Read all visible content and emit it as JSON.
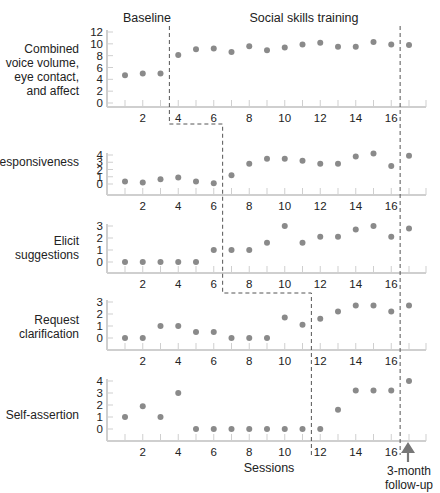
{
  "chart_data": {
    "type": "scatter",
    "layout": "multiple-baseline (5 stacked panels, shared x-axis)",
    "title": "",
    "phase_labels": [
      "Baseline",
      "Social skills training"
    ],
    "xlabel": "Sessions",
    "x_ticks": [
      2,
      4,
      6,
      8,
      10,
      12,
      14,
      16
    ],
    "x": [
      1,
      2,
      3,
      4,
      5,
      6,
      7,
      8,
      9,
      10,
      11,
      12,
      13,
      14,
      15,
      16,
      17
    ],
    "followup": {
      "x": 17,
      "label_line1": "3-month",
      "label_line2": "follow-up"
    },
    "grid": false,
    "legend": null,
    "panels": [
      {
        "label_lines": [
          "Combined",
          "voice volume,",
          "eye contact,",
          "and affect"
        ],
        "ylim": [
          0,
          12
        ],
        "y_ticks": [
          0,
          2,
          4,
          6,
          8,
          10,
          12
        ],
        "phase_change_after": 3.5,
        "values": [
          4.7,
          5.0,
          5.0,
          8.1,
          9.1,
          9.2,
          8.6,
          9.6,
          8.9,
          9.4,
          9.9,
          10.2,
          9.5,
          9.5,
          10.3,
          9.9,
          9.8
        ]
      },
      {
        "label_lines": [
          "Responsiveness"
        ],
        "ylim": [
          0,
          4
        ],
        "y_ticks": [
          0,
          1,
          2,
          3,
          4
        ],
        "phase_change_after": 6.5,
        "values": [
          0.35,
          0.2,
          0.65,
          0.9,
          0.35,
          0.1,
          1.2,
          2.8,
          3.5,
          3.5,
          3.2,
          2.8,
          2.8,
          3.8,
          4.2,
          2.5,
          3.9
        ]
      },
      {
        "label_lines": [
          "Elicit",
          "suggestions"
        ],
        "ylim": [
          0,
          3
        ],
        "y_ticks": [
          0,
          1,
          2,
          3
        ],
        "phase_change_after": 6.5,
        "values": [
          0,
          0,
          0,
          0,
          0,
          1,
          1,
          1,
          1.6,
          3.0,
          1.6,
          2.1,
          2.1,
          2.7,
          3.0,
          2.1,
          2.8
        ]
      },
      {
        "label_lines": [
          "Request",
          "clarification"
        ],
        "ylim": [
          0,
          3
        ],
        "y_ticks": [
          0,
          1,
          2,
          3
        ],
        "phase_change_after": 11.5,
        "values": [
          0,
          0,
          1,
          1,
          0.5,
          0.5,
          0,
          0,
          0,
          1.7,
          1.1,
          1.6,
          2.2,
          2.7,
          2.7,
          2.2,
          2.7
        ]
      },
      {
        "label_lines": [
          "Self-assertion"
        ],
        "ylim": [
          0,
          4
        ],
        "y_ticks": [
          0,
          1,
          2,
          3,
          4
        ],
        "phase_change_after": 11.5,
        "values": [
          1,
          1.9,
          1,
          3,
          0,
          0,
          0,
          0,
          0,
          0,
          0,
          0,
          1.6,
          3.2,
          3.2,
          3.2,
          4.0
        ]
      }
    ],
    "followup_divider_after": 16.5
  }
}
